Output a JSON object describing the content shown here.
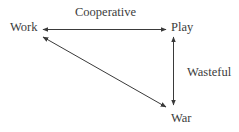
{
  "diagram": {
    "nodes": [
      {
        "id": "work",
        "label": "Work"
      },
      {
        "id": "play",
        "label": "Play"
      },
      {
        "id": "war",
        "label": "War"
      }
    ],
    "edges": [
      {
        "from": "work",
        "to": "play",
        "label": "Cooperative",
        "direction": "bidirectional"
      },
      {
        "from": "play",
        "to": "war",
        "label": "Wasteful",
        "direction": "bidirectional"
      },
      {
        "from": "work",
        "to": "war",
        "label": "",
        "direction": "bidirectional"
      }
    ],
    "colors": {
      "line": "#3a3a3a",
      "text": "#3c3c3c",
      "background": "#ffffff"
    }
  }
}
